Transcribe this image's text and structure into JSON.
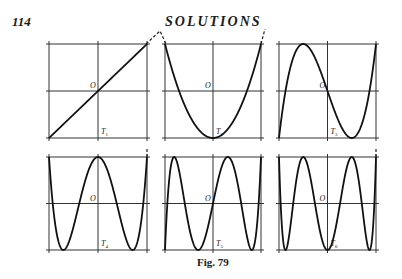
{
  "page": {
    "page_number": "114",
    "running_head": "SOLUTIONS",
    "caption": "Fig. 79"
  },
  "figure": {
    "origin_label": "O",
    "panels": [
      {
        "id": "T1",
        "label": "T",
        "subscript": "1",
        "degree": 1
      },
      {
        "id": "T2",
        "label": "T",
        "subscript": "2",
        "degree": 2
      },
      {
        "id": "T3",
        "label": "T",
        "subscript": "3",
        "degree": 3
      },
      {
        "id": "T4",
        "label": "T",
        "subscript": "4",
        "degree": 4
      },
      {
        "id": "T5",
        "label": "T",
        "subscript": "5",
        "degree": 5
      },
      {
        "id": "T6",
        "label": "T",
        "subscript": "6",
        "degree": 6
      }
    ]
  }
}
